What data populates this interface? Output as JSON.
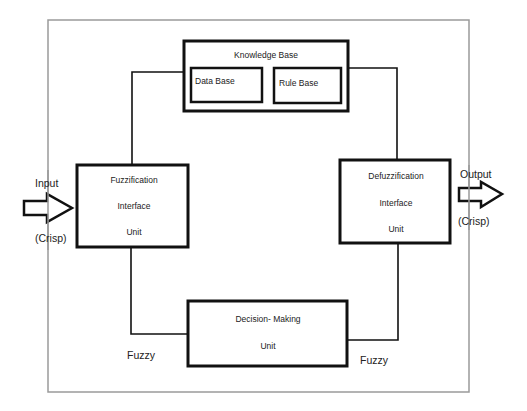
{
  "diagram": {
    "colors": {
      "stroke": "#111111",
      "frame": "#9a9a9a",
      "text": "#222222",
      "background": "#ffffff"
    },
    "knowledge_base": {
      "label": "Knowledge Base",
      "data_base": {
        "label": "Data Base"
      },
      "rule_base": {
        "label": "Rule Base"
      }
    },
    "fuzzification": {
      "lines": [
        "Fuzzification",
        "Interface",
        "Unit"
      ]
    },
    "defuzzification": {
      "lines": [
        "Defuzzification",
        "Interface",
        "Unit"
      ]
    },
    "decision_making": {
      "lines": [
        "Decision- Making",
        "Unit"
      ]
    },
    "input": {
      "label": "Input",
      "type": "(Crisp)"
    },
    "output": {
      "label": "Output",
      "type": "(Crisp)"
    },
    "edge_labels": {
      "left_fuzzy": "Fuzzy",
      "right_fuzzy": "Fuzzy"
    }
  }
}
